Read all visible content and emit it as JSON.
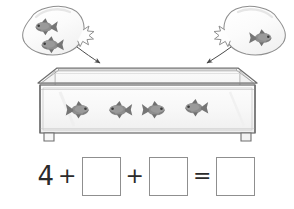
{
  "worksheet": {
    "title": "Fish tank addition worksheet",
    "scene_description": "Aquarium with fish and two bags of fish being added"
  },
  "tank": {
    "name": "aquarium-tank",
    "fish_count": 4,
    "fish_positions": [
      {
        "x": 80,
        "y": 110
      },
      {
        "x": 118,
        "y": 110
      },
      {
        "x": 156,
        "y": 110
      },
      {
        "x": 194,
        "y": 108
      }
    ],
    "glass_color": "#fbfbfb",
    "frame_color": "#7d7d7d"
  },
  "bags": [
    {
      "name": "fish-bag-left",
      "fish_count": 2,
      "side": "left",
      "fish_positions": [
        {
          "x": 44,
          "y": 27
        },
        {
          "x": 50,
          "y": 45
        }
      ],
      "fill_color": "#fcfcfc",
      "outline_color": "#8a8a8a"
    },
    {
      "name": "fish-bag-right",
      "fish_count": 1,
      "side": "right",
      "fish_positions": [
        {
          "x": 263,
          "y": 38
        }
      ],
      "fill_color": "#fcfcfc",
      "outline_color": "#8a8a8a"
    }
  ],
  "arrows": [
    {
      "name": "arrow-left-bag-to-tank",
      "from": {
        "x": 76,
        "y": 48
      },
      "to": {
        "x": 100,
        "y": 64
      }
    },
    {
      "name": "arrow-right-bag-to-tank",
      "from": {
        "x": 232,
        "y": 48
      },
      "to": {
        "x": 208,
        "y": 64
      }
    }
  ],
  "equation": {
    "name": "addition-equation",
    "known_value": "4",
    "plus_1": "+",
    "plus_2": "+",
    "equals": "=",
    "blank_1": "",
    "blank_2": "",
    "blank_answer": "",
    "blank_count": 3
  },
  "colors": {
    "fish_body": "#8c8c8c",
    "fish_dark": "#6b6b6b",
    "outline": "#808080",
    "ink": "#2b2b2b",
    "box_border": "#8f8f8f"
  }
}
